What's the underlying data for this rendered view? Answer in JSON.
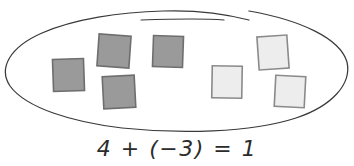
{
  "figure": {
    "kind": "integer-counter-model-diagram",
    "background_color": "#ffffff",
    "width": 354,
    "height": 166
  },
  "grouping_oval": {
    "name": "hand-drawn-oval",
    "stroke_color": "#3a3a3a",
    "stroke_width": 1.2,
    "fill": "none",
    "open_at_top": true,
    "center_x": 177,
    "center_y": 72,
    "radius_x": 172,
    "radius_y": 60
  },
  "counters": {
    "dark_fill": "#9a9a9a",
    "dark_stroke": "#6e6e6e",
    "light_fill": "#ededed",
    "light_stroke": "#8a8a8a",
    "dark_count": 4,
    "light_count": 4,
    "dark_label": "positive-counter",
    "light_label": "negative-counter",
    "items": [
      {
        "id": "dark-1",
        "type": "dark",
        "x": 53,
        "y": 59,
        "w": 31,
        "h": 32,
        "rotation": -2
      },
      {
        "id": "dark-2",
        "type": "dark",
        "x": 98,
        "y": 35,
        "w": 32,
        "h": 32,
        "rotation": 4
      },
      {
        "id": "dark-3",
        "type": "dark",
        "x": 103,
        "y": 76,
        "w": 32,
        "h": 32,
        "rotation": -3
      },
      {
        "id": "dark-4",
        "type": "dark",
        "x": 153,
        "y": 36,
        "w": 30,
        "h": 31,
        "rotation": 2
      },
      {
        "id": "light-1",
        "type": "light",
        "x": 212,
        "y": 66,
        "w": 30,
        "h": 32,
        "rotation": 1
      },
      {
        "id": "light-2",
        "type": "light",
        "x": 258,
        "y": 36,
        "w": 30,
        "h": 33,
        "rotation": -4
      },
      {
        "id": "light-3",
        "type": "light",
        "x": 275,
        "y": 76,
        "w": 30,
        "h": 31,
        "rotation": 3
      }
    ]
  },
  "equation": {
    "name": "integer-addition-equation",
    "text": "4 + (−3) = 1",
    "left_addend": "4",
    "right_addend": "(−3)",
    "sum": "1",
    "operator": "+",
    "equals": "=",
    "color": "#2b2b2b"
  }
}
